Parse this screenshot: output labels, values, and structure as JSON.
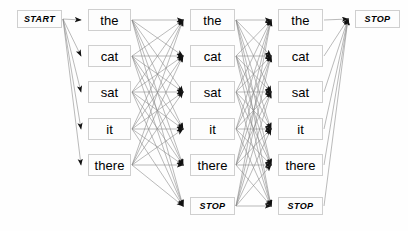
{
  "diagram": {
    "type": "lattice-graph",
    "canvas": {
      "width": 408,
      "height": 231
    },
    "colors": {
      "background": "#fefefe",
      "node_fill": "#fdfdfd",
      "node_border": "#cfcfcf",
      "edge": "#8c8c8c",
      "arrowhead": "#111111",
      "text": "#000000"
    },
    "vocabulary": [
      "the",
      "cat",
      "sat",
      "it",
      "there"
    ],
    "start_label": "START",
    "stop_label": "STOP",
    "columns": [
      {
        "id": "col-start",
        "name": "start-column",
        "x": 17,
        "width": 45,
        "nodes": [
          {
            "id": "n-start",
            "label": "START",
            "terminal": true,
            "y": 10,
            "height": 18
          }
        ]
      },
      {
        "id": "col-1",
        "name": "word-column-1",
        "x": 88,
        "width": 43,
        "nodes": [
          {
            "id": "c1-the",
            "label": "the",
            "terminal": false,
            "y": 9,
            "height": 22
          },
          {
            "id": "c1-cat",
            "label": "cat",
            "terminal": false,
            "y": 45,
            "height": 22
          },
          {
            "id": "c1-sat",
            "label": "sat",
            "terminal": false,
            "y": 81,
            "height": 22
          },
          {
            "id": "c1-it",
            "label": "it",
            "terminal": false,
            "y": 118,
            "height": 22
          },
          {
            "id": "c1-there",
            "label": "there",
            "terminal": false,
            "y": 154,
            "height": 22
          }
        ]
      },
      {
        "id": "col-2",
        "name": "word-column-2",
        "x": 190,
        "width": 45,
        "nodes": [
          {
            "id": "c2-the",
            "label": "the",
            "terminal": false,
            "y": 9,
            "height": 22
          },
          {
            "id": "c2-cat",
            "label": "cat",
            "terminal": false,
            "y": 45,
            "height": 22
          },
          {
            "id": "c2-sat",
            "label": "sat",
            "terminal": false,
            "y": 81,
            "height": 22
          },
          {
            "id": "c2-it",
            "label": "it",
            "terminal": false,
            "y": 118,
            "height": 22
          },
          {
            "id": "c2-there",
            "label": "there",
            "terminal": false,
            "y": 154,
            "height": 22
          },
          {
            "id": "c2-stop",
            "label": "STOP",
            "terminal": true,
            "y": 197,
            "height": 18
          }
        ]
      },
      {
        "id": "col-3",
        "name": "word-column-3",
        "x": 278,
        "width": 45,
        "nodes": [
          {
            "id": "c3-the",
            "label": "the",
            "terminal": false,
            "y": 9,
            "height": 22
          },
          {
            "id": "c3-cat",
            "label": "cat",
            "terminal": false,
            "y": 45,
            "height": 22
          },
          {
            "id": "c3-sat",
            "label": "sat",
            "terminal": false,
            "y": 81,
            "height": 22
          },
          {
            "id": "c3-it",
            "label": "it",
            "terminal": false,
            "y": 118,
            "height": 22
          },
          {
            "id": "c3-there",
            "label": "there",
            "terminal": false,
            "y": 154,
            "height": 22
          },
          {
            "id": "c3-stop",
            "label": "STOP",
            "terminal": true,
            "y": 197,
            "height": 18
          }
        ]
      },
      {
        "id": "col-stop",
        "name": "stop-column",
        "x": 355,
        "width": 45,
        "nodes": [
          {
            "id": "n-stop",
            "label": "STOP",
            "terminal": true,
            "y": 10,
            "height": 18
          }
        ]
      }
    ],
    "edge_groups": [
      {
        "name": "start-to-column-1",
        "from": "col-start",
        "to": "col-1",
        "fully_connected": true
      },
      {
        "name": "column-1-to-column-2",
        "from": "col-1",
        "to": "col-2",
        "fully_connected": true
      },
      {
        "name": "column-2-to-column-3",
        "from": "col-2",
        "to": "col-3",
        "fully_connected": true
      },
      {
        "name": "column-3-to-stop",
        "from": "col-3",
        "to": "col-stop",
        "fully_connected": true
      }
    ]
  }
}
